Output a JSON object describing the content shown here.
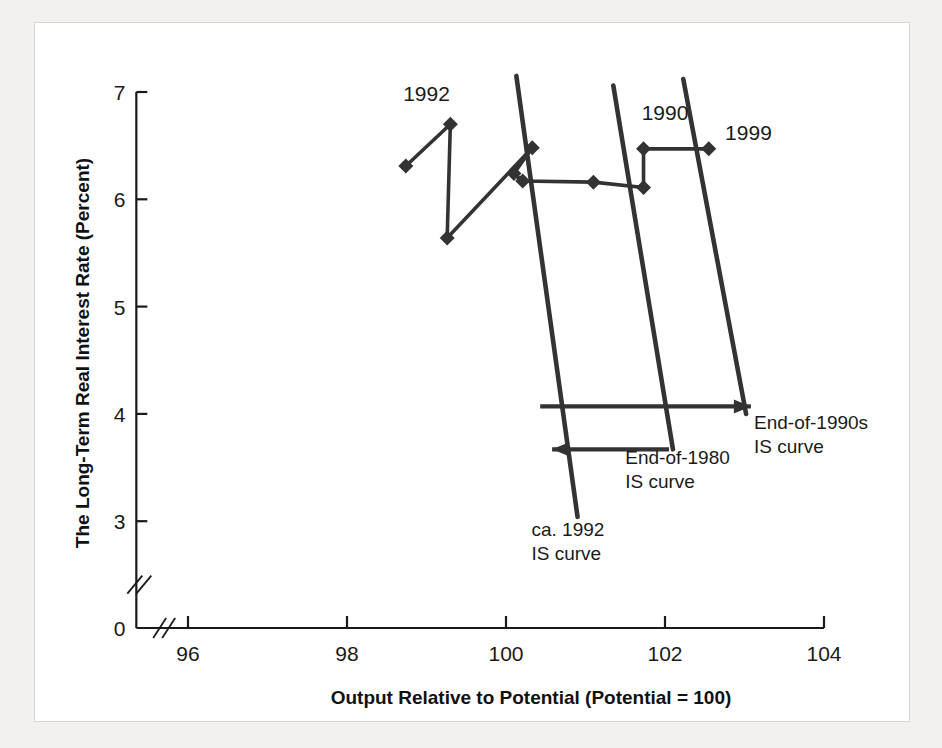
{
  "figure": {
    "background_color": "#ffffff",
    "page_color": "#f2f1ef",
    "ink_color": "#333333"
  },
  "chart_data": {
    "type": "line",
    "title": "",
    "xlabel": "Output Relative to Potential (Potential = 100)",
    "ylabel": "The Long-Term Real Interest Rate (Percent)",
    "xlim": [
      95.3,
      104.3
    ],
    "ylim": [
      2.62,
      7.15
    ],
    "xticks": [
      96,
      98,
      100,
      102,
      104
    ],
    "xticklabels": [
      "96",
      "98",
      "100",
      "102",
      "104"
    ],
    "yticks": [
      3,
      4,
      5,
      6,
      7
    ],
    "yticklabels": [
      "3",
      "4",
      "5",
      "6",
      "7"
    ],
    "y_zero_label": "0",
    "x_axis_break": true,
    "y_axis_break": true,
    "grid": false,
    "legend": "none",
    "series": [
      {
        "name": "observed-path",
        "marker": "diamond",
        "points": [
          {
            "x": 98.74,
            "y": 6.31
          },
          {
            "x": 99.3,
            "y": 6.7
          },
          {
            "x": 99.26,
            "y": 5.64
          },
          {
            "x": 100.33,
            "y": 6.48
          },
          {
            "x": 100.1,
            "y": 6.24
          },
          {
            "x": 100.21,
            "y": 6.17
          },
          {
            "x": 101.1,
            "y": 6.16
          },
          {
            "x": 101.73,
            "y": 6.11
          },
          {
            "x": 101.73,
            "y": 6.47
          },
          {
            "x": 102.55,
            "y": 6.47
          }
        ]
      }
    ],
    "point_labels": [
      {
        "text": "1992",
        "x": 99.0,
        "y": 6.92
      },
      {
        "text": "1990",
        "x": 102.0,
        "y": 6.74
      },
      {
        "text": "1999",
        "x": 103.05,
        "y": 6.55
      }
    ],
    "is_curves": [
      {
        "name": "ca-1992-is-curve",
        "label_line1": "ca. 1992",
        "label_line2": "IS curve",
        "x_top": 100.13,
        "y_top": 7.15,
        "x_bottom": 100.9,
        "y_bottom": 3.04,
        "label_x": 100.32,
        "label_y": 2.86
      },
      {
        "name": "end-of-1980-is-curve",
        "label_line1": "End-of-1980",
        "label_line2": "IS curve",
        "x_top": 101.35,
        "y_top": 7.06,
        "x_bottom": 102.1,
        "y_bottom": 3.67,
        "label_x": 101.5,
        "label_y": 3.53
      },
      {
        "name": "end-of-1990s-is-curve",
        "label_line1": "End-of-1990s",
        "label_line2": "IS curve",
        "x_top": 102.23,
        "y_top": 7.12,
        "x_bottom": 103.02,
        "y_bottom": 4.0,
        "label_x": 103.12,
        "label_y": 3.86
      }
    ],
    "arrows": [
      {
        "name": "rightward-shift-arrow",
        "x_start": 100.43,
        "y_start": 4.07,
        "x_end": 103.08,
        "y_end": 4.07,
        "direction": "right"
      },
      {
        "name": "leftward-shift-arrow",
        "x_start": 102.05,
        "y_start": 3.67,
        "x_end": 100.58,
        "y_end": 3.67,
        "direction": "left"
      }
    ]
  }
}
